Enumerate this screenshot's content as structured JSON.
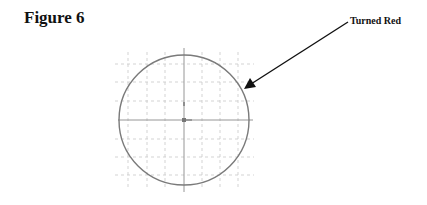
{
  "figure": {
    "title": "Figure 6",
    "annotation": "Turned Red"
  },
  "drawing": {
    "center": [
      184,
      120
    ],
    "radius": 65,
    "circle_color": "#7a7a7a",
    "axis_color": "#8a8a8a",
    "grid_color": "#c8c8c8",
    "arrow_color": "#111111",
    "grid_x": [
      128,
      147,
      165,
      202,
      220,
      238
    ],
    "grid_y": [
      64,
      82,
      101,
      139,
      157,
      175
    ],
    "arrow": {
      "from": [
        348,
        22
      ],
      "to": [
        245,
        88
      ]
    }
  }
}
